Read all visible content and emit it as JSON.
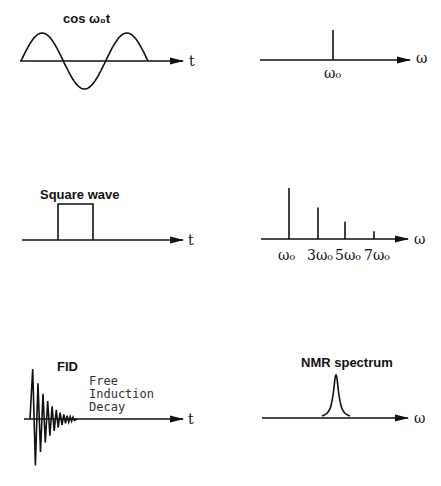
{
  "panels": {
    "cosine_time": {
      "title": "cos ω₀t",
      "axis_label": "t",
      "periods": 1.5
    },
    "cosine_freq": {
      "axis_label": "ω",
      "peak_label": "ω₀"
    },
    "square_time": {
      "title": "Square wave",
      "axis_label": "t"
    },
    "square_freq": {
      "axis_label": "ω",
      "harmonics": [
        {
          "label": "ω₀",
          "multiple": 1,
          "amplitude": 1.0
        },
        {
          "label": "3ω₀",
          "multiple": 3,
          "amplitude": 0.62
        },
        {
          "label": "5ω₀",
          "multiple": 5,
          "amplitude": 0.34
        },
        {
          "label": "7ω₀",
          "multiple": 7,
          "amplitude": 0.15
        }
      ]
    },
    "fid_time": {
      "title": "FID",
      "subtitle_lines": [
        "Free",
        "Induction",
        "Decay"
      ],
      "axis_label": "t"
    },
    "nmr_freq": {
      "title": "NMR spectrum",
      "axis_label": "ω"
    }
  }
}
